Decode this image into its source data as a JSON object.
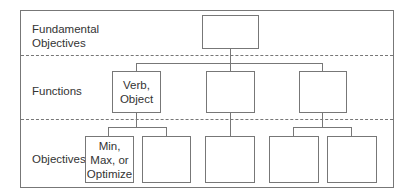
{
  "diagram": {
    "levels": [
      {
        "label": "Fundamental\nObjectives"
      },
      {
        "label": "Functions"
      },
      {
        "label": "Objectives"
      }
    ],
    "fundamental_box": {
      "text": ""
    },
    "functions": [
      {
        "text": "Verb,\nObject"
      },
      {
        "text": ""
      },
      {
        "text": ""
      }
    ],
    "objectives": [
      {
        "text": "Min,\nMax, or\nOptimize"
      },
      {
        "text": ""
      },
      {
        "text": ""
      },
      {
        "text": ""
      },
      {
        "text": ""
      }
    ],
    "colors": {
      "line": "#777777",
      "text": "#333333",
      "background": "#ffffff"
    }
  }
}
